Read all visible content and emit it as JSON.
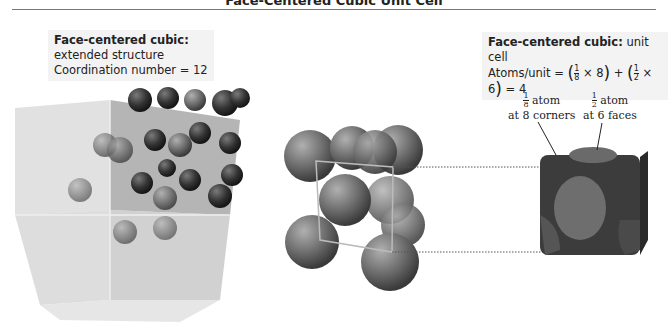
{
  "title": "Face-Centered Cubic Unit Cell",
  "left_box": {
    "heading": "Face-centered cubic:",
    "line1": "extended structure",
    "line2": "Coordination number = 12"
  },
  "right_box": {
    "heading": "Face-centered cubic:",
    "heading_rest": " unit cell",
    "formula_prefix": "Atoms/unit = ",
    "frac1_num": "1",
    "frac1_den": "8",
    "mult1": " × 8",
    "plus": " + ",
    "frac2_num": "1",
    "frac2_den": "2",
    "mult2": " × 6",
    "result": " = 4"
  },
  "labels": {
    "corner": {
      "num": "1",
      "den": "8",
      "word": " atom",
      "line2": "at 8 corners"
    },
    "face": {
      "num": "1",
      "den": "2",
      "word": " atom",
      "line2": "at 6 faces"
    }
  },
  "colors": {
    "atom": "#6e6e6e",
    "atom_dark": "#2e2e2e",
    "cube_glass": "#c8c8c8",
    "box_bg": "#f3f3f3"
  }
}
